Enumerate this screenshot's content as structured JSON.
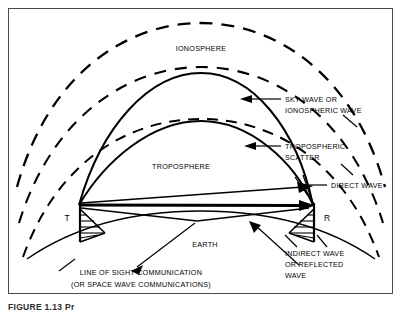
{
  "figure": {
    "caption": "FIGURE 1.13  Pr",
    "frame_color": "#4a4a4a",
    "ink_color": "#000000",
    "background": "#ffffff"
  },
  "diagram": {
    "region_labels": {
      "ionosphere": "IONOSPHERE",
      "troposphere": "TROPOSPHERE",
      "earth": "EARTH"
    },
    "station_markers": {
      "transmitter": "T",
      "receiver": "R"
    },
    "callouts": [
      {
        "id": "sky-wave",
        "line1": "SKY WAVE OR",
        "line2": "IONOSPHERIC WAVE"
      },
      {
        "id": "tropospheric-scatter",
        "line1": "TROPOSPHERIC",
        "line2": "SCATTER"
      },
      {
        "id": "direct-wave",
        "line1": "DIRECT WAVE",
        "line2": ""
      },
      {
        "id": "indirect-wave",
        "line1": "INDIRECT WAVE",
        "line2": "OR REFLECTED",
        "line3": "WAVE"
      }
    ],
    "bottom_note": {
      "line1": "LINE OF SIGHT COMMUNICATION",
      "line2": "(OR SPACE WAVE COMMUNICATIONS)"
    }
  }
}
